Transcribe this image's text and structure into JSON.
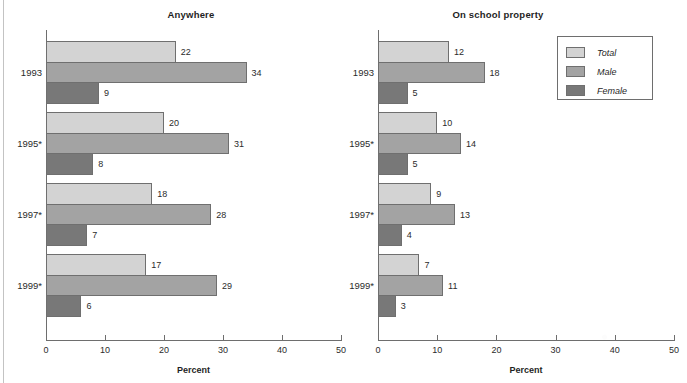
{
  "figure": {
    "x_axis_label": "Percent",
    "legend": {
      "items": [
        {
          "key": "total",
          "label": "Total",
          "color": "#d3d3d3"
        },
        {
          "key": "male",
          "label": "Male",
          "color": "#a3a3a3"
        },
        {
          "key": "female",
          "label": "Female",
          "color": "#787878"
        }
      ]
    }
  },
  "chart_data": [
    {
      "type": "bar",
      "orientation": "horizontal",
      "title": "Anywhere",
      "xlabel": "Percent",
      "ylabel": "",
      "xlim": [
        0,
        50
      ],
      "xticks": [
        0,
        10,
        20,
        30,
        40,
        50
      ],
      "xticklabels": [
        "0",
        "10",
        "20",
        "30",
        "40",
        "50"
      ],
      "grid": false,
      "legend_position": "outside-top-right",
      "categories": [
        "1993",
        "1995*",
        "1997*",
        "1999*"
      ],
      "series": [
        {
          "name": "Total",
          "color": "#d3d3d3",
          "values": [
            22,
            20,
            18,
            17
          ]
        },
        {
          "name": "Male",
          "color": "#a3a3a3",
          "values": [
            34,
            31,
            28,
            29
          ]
        },
        {
          "name": "Female",
          "color": "#787878",
          "values": [
            9,
            8,
            7,
            6
          ]
        }
      ]
    },
    {
      "type": "bar",
      "orientation": "horizontal",
      "title": "On school property",
      "xlabel": "Percent",
      "ylabel": "",
      "xlim": [
        0,
        50
      ],
      "xticks": [
        0,
        10,
        20,
        30,
        40,
        50
      ],
      "xticklabels": [
        "0",
        "10",
        "20",
        "30",
        "40",
        "50"
      ],
      "grid": false,
      "legend_position": "outside-top-right",
      "categories": [
        "1993",
        "1995*",
        "1997*",
        "1999*"
      ],
      "series": [
        {
          "name": "Total",
          "color": "#d3d3d3",
          "values": [
            12,
            10,
            9,
            7
          ]
        },
        {
          "name": "Male",
          "color": "#a3a3a3",
          "values": [
            18,
            14,
            13,
            11
          ]
        },
        {
          "name": "Female",
          "color": "#787878",
          "values": [
            5,
            5,
            4,
            3
          ]
        }
      ]
    }
  ]
}
